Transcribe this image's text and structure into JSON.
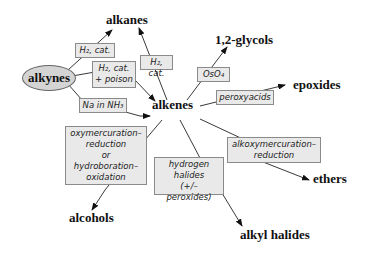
{
  "nodes": {
    "alkynes": "alkynes",
    "alkanes": "alkanes",
    "alkenes": "alkenes",
    "glycols": "1,2-glycols",
    "epoxides": "epoxides",
    "ethers": "ethers",
    "alcohols": "alcohols",
    "alkyl_halides": "alkyl halides"
  },
  "reagents": {
    "h2_cat_alkyne": "H₂, cat.",
    "h2_cat_poison": [
      "H₂, cat.",
      "+ poison"
    ],
    "h2_cat_alkene": "H₂, cat.",
    "na_nh3": "Na in NH₃",
    "oso4": "OsO₄",
    "peroxyacids": "peroxyacids",
    "oxymercuration": [
      "oxymercuration–",
      "reduction",
      "or",
      "hydroboration–",
      "oxidation"
    ],
    "hydrogen_halides": [
      "hydrogen",
      "halides",
      "(+/– peroxides)"
    ],
    "alkoxymercuration": [
      "alkoxymercuration–",
      "reduction"
    ]
  },
  "colors": {
    "box_fill": "#e9e9e9",
    "box_border": "#8a8a8a",
    "oval_fill": "#d4d4d4",
    "line": "#222222"
  }
}
